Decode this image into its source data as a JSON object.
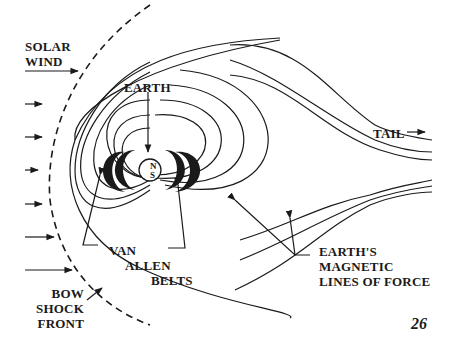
{
  "diagram": {
    "labels": {
      "solar_wind": [
        "SOLAR",
        "WIND"
      ],
      "earth": "EARTH",
      "tail": "TAIL",
      "van_allen": [
        "VAN",
        "ALLEN",
        "BELTS"
      ],
      "bow_shock": [
        "BOW",
        "SHOCK",
        "FRONT"
      ],
      "magnetic_lines": [
        "EARTH'S",
        "MAGNETIC",
        "LINES OF FORCE"
      ],
      "north": "N",
      "south": "S"
    },
    "page_number": "26",
    "colors": {
      "ink": "#1a1a1a",
      "background": "#ffffff"
    }
  }
}
